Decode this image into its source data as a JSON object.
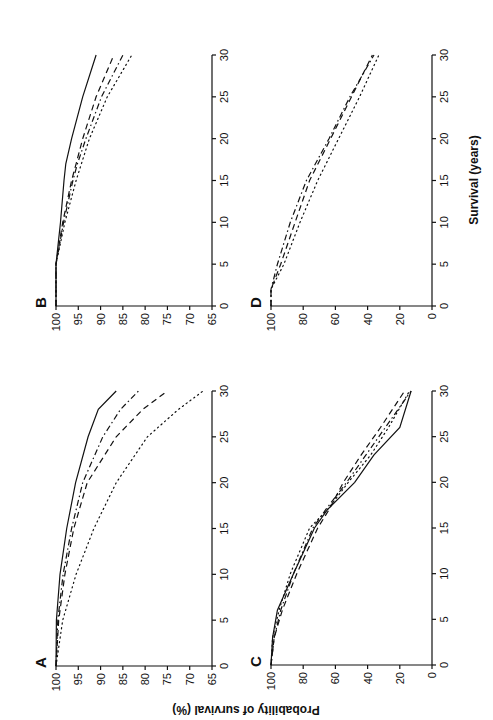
{
  "figure": {
    "orientation": "rotated 90 degrees counter-clockwise",
    "ylabel": "Probability of survival (%)",
    "xlabel": "Survival (years)"
  },
  "chart_data": [
    {
      "panel": "A",
      "type": "line",
      "title": "A",
      "xlabel": "Survival (years)",
      "ylabel": "Probability of survival (%)",
      "xlim": [
        0,
        30
      ],
      "ylim": [
        65,
        100
      ],
      "xticks": [
        "0",
        "5",
        "10",
        "15",
        "20",
        "25",
        "30"
      ],
      "yticks": [
        "100",
        "95",
        "90",
        "85",
        "80",
        "75",
        "70",
        "65"
      ],
      "x": [
        0,
        5,
        10,
        15,
        20,
        25,
        28,
        30
      ],
      "series": [
        {
          "name": "solid",
          "style": "solid",
          "values": [
            100,
            99.9,
            99.1,
            97.6,
            95.6,
            92.8,
            90.5,
            86.5
          ]
        },
        {
          "name": "dash-dot",
          "style": "dashdot",
          "values": [
            100,
            99.6,
            98.4,
            96.5,
            94.0,
            89.5,
            85.5,
            81.5
          ]
        },
        {
          "name": "dashed",
          "style": "dashed",
          "values": [
            100,
            99.4,
            98.0,
            96.0,
            93.0,
            86.5,
            80.5,
            75.0
          ]
        },
        {
          "name": "dotted",
          "style": "dotted",
          "values": [
            100,
            98.5,
            95.5,
            91.5,
            86.5,
            79.5,
            72.5,
            67.0
          ]
        }
      ]
    },
    {
      "panel": "B",
      "type": "line",
      "title": "B",
      "xlabel": "Survival (years)",
      "ylabel": "Probability of survival (%)",
      "xlim": [
        0,
        30
      ],
      "ylim": [
        65,
        100
      ],
      "xticks": [
        "0",
        "5",
        "10",
        "15",
        "20",
        "25",
        "30"
      ],
      "yticks": [
        "100",
        "95",
        "90",
        "85",
        "80",
        "75",
        "70",
        "65"
      ],
      "x": [
        0,
        5,
        10,
        15,
        17,
        20,
        25,
        30
      ],
      "series": [
        {
          "name": "solid",
          "style": "solid",
          "values": [
            100,
            100,
            99.0,
            98.2,
            97.8,
            96.5,
            94.0,
            91.0
          ]
        },
        {
          "name": "dashed",
          "style": "dashed",
          "values": [
            100,
            100,
            98.5,
            96.5,
            95.5,
            94.0,
            91.0,
            87.0
          ]
        },
        {
          "name": "dash-dot",
          "style": "dashdot",
          "values": [
            100,
            100,
            98.3,
            96.2,
            95.2,
            93.3,
            89.8,
            85.0
          ]
        },
        {
          "name": "dotted",
          "style": "dotted",
          "values": [
            100,
            100,
            98.0,
            95.5,
            94.3,
            92.5,
            88.5,
            83.0
          ]
        }
      ]
    },
    {
      "panel": "C",
      "type": "line",
      "title": "C",
      "xlabel": "Survival (years)",
      "ylabel": "Probability of survival (%)",
      "xlim": [
        0,
        30
      ],
      "ylim": [
        0,
        100
      ],
      "xticks": [
        "0",
        "5",
        "10",
        "15",
        "20",
        "25",
        "30"
      ],
      "yticks": [
        "100",
        "80",
        "60",
        "40",
        "20",
        "0"
      ],
      "x": [
        0,
        3,
        6,
        10,
        15,
        17,
        20,
        23,
        26,
        30
      ],
      "series": [
        {
          "name": "solid",
          "style": "solid",
          "values": [
            100,
            99,
            96,
            86,
            73,
            65,
            48,
            36,
            20,
            13
          ]
        },
        {
          "name": "dashed",
          "style": "dashed",
          "values": [
            100,
            98,
            93,
            84,
            71,
            64,
            55,
            44,
            32,
            17
          ]
        },
        {
          "name": "dash-dot",
          "style": "dashdot",
          "values": [
            100,
            98,
            94,
            86,
            74,
            66,
            53,
            41,
            29,
            13
          ]
        },
        {
          "name": "dotted",
          "style": "dotted",
          "values": [
            100,
            99,
            95,
            88,
            76,
            65,
            52,
            38,
            27,
            14
          ]
        }
      ]
    },
    {
      "panel": "D",
      "type": "line",
      "title": "D",
      "xlabel": "Survival (years)",
      "ylabel": "Probability of survival (%)",
      "xlim": [
        0,
        30
      ],
      "ylim": [
        0,
        100
      ],
      "xticks": [
        "0",
        "5",
        "10",
        "15",
        "20",
        "25",
        "30"
      ],
      "yticks": [
        "100",
        "80",
        "60",
        "40",
        "20",
        "0"
      ],
      "x": [
        0,
        2,
        5,
        10,
        15,
        20,
        25,
        30
      ],
      "series": [
        {
          "name": "dash-dot",
          "style": "dashdot",
          "values": [
            100,
            100,
            96,
            88,
            78,
            64,
            51,
            36
          ]
        },
        {
          "name": "dashed",
          "style": "dashed",
          "values": [
            100,
            100,
            94,
            85,
            76,
            63,
            50,
            37
          ]
        },
        {
          "name": "dotted",
          "style": "dotted",
          "values": [
            100,
            100,
            92,
            82,
            71,
            58,
            45,
            33
          ]
        }
      ]
    }
  ]
}
